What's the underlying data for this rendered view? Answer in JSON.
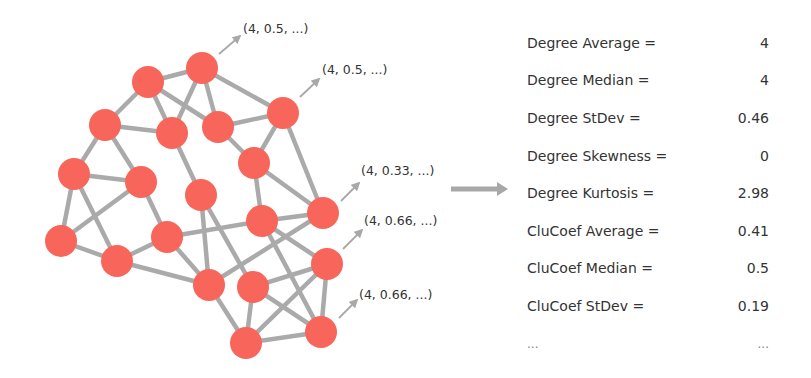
{
  "colors": {
    "node": "#F8655A",
    "edge": "#AAAAAA",
    "arrow": "#A8A8A8",
    "text": "#333333"
  },
  "graph": {
    "node_radius": 16,
    "nodes": [
      {
        "id": "A",
        "x": 202,
        "y": 68
      },
      {
        "id": "B",
        "x": 148,
        "y": 82
      },
      {
        "id": "C",
        "x": 105,
        "y": 125
      },
      {
        "id": "D",
        "x": 172,
        "y": 133
      },
      {
        "id": "E",
        "x": 218,
        "y": 127
      },
      {
        "id": "F",
        "x": 283,
        "y": 113
      },
      {
        "id": "G",
        "x": 254,
        "y": 163
      },
      {
        "id": "H",
        "x": 74,
        "y": 174
      },
      {
        "id": "I",
        "x": 141,
        "y": 182
      },
      {
        "id": "J",
        "x": 201,
        "y": 195
      },
      {
        "id": "K",
        "x": 323,
        "y": 213
      },
      {
        "id": "L",
        "x": 262,
        "y": 221
      },
      {
        "id": "M",
        "x": 61,
        "y": 241
      },
      {
        "id": "N",
        "x": 167,
        "y": 237
      },
      {
        "id": "O",
        "x": 117,
        "y": 261
      },
      {
        "id": "P",
        "x": 327,
        "y": 264
      },
      {
        "id": "Q",
        "x": 209,
        "y": 285
      },
      {
        "id": "R",
        "x": 253,
        "y": 287
      },
      {
        "id": "S",
        "x": 321,
        "y": 332
      },
      {
        "id": "T",
        "x": 246,
        "y": 343
      }
    ],
    "edges": [
      [
        "B",
        "A"
      ],
      [
        "B",
        "C"
      ],
      [
        "B",
        "D"
      ],
      [
        "B",
        "E"
      ],
      [
        "A",
        "D"
      ],
      [
        "A",
        "E"
      ],
      [
        "A",
        "F"
      ],
      [
        "C",
        "D"
      ],
      [
        "C",
        "H"
      ],
      [
        "C",
        "I"
      ],
      [
        "E",
        "F"
      ],
      [
        "E",
        "G"
      ],
      [
        "F",
        "G"
      ],
      [
        "F",
        "K"
      ],
      [
        "D",
        "J"
      ],
      [
        "G",
        "K"
      ],
      [
        "G",
        "L"
      ],
      [
        "H",
        "I"
      ],
      [
        "H",
        "M"
      ],
      [
        "H",
        "O"
      ],
      [
        "I",
        "M"
      ],
      [
        "I",
        "N"
      ],
      [
        "M",
        "O"
      ],
      [
        "O",
        "N"
      ],
      [
        "O",
        "Q"
      ],
      [
        "N",
        "Q"
      ],
      [
        "N",
        "L"
      ],
      [
        "J",
        "Q"
      ],
      [
        "J",
        "R"
      ],
      [
        "L",
        "K"
      ],
      [
        "L",
        "P"
      ],
      [
        "L",
        "S"
      ],
      [
        "K",
        "Q"
      ],
      [
        "R",
        "P"
      ],
      [
        "R",
        "T"
      ],
      [
        "R",
        "S"
      ],
      [
        "P",
        "T"
      ],
      [
        "P",
        "S"
      ],
      [
        "Q",
        "T"
      ],
      [
        "T",
        "S"
      ]
    ],
    "annotations": [
      {
        "text": "(4, 0.5, ...)",
        "from": [
          219,
          54
        ],
        "to": [
          240,
          36
        ],
        "label_x": 243,
        "label_y": 21
      },
      {
        "text": "(4, 0.5, ...)",
        "from": [
          300,
          97
        ],
        "to": [
          319,
          79
        ],
        "label_x": 322,
        "label_y": 62
      },
      {
        "text": "(4, 0.33, ...)",
        "from": [
          341,
          201
        ],
        "to": [
          359,
          183
        ],
        "label_x": 361,
        "label_y": 163
      },
      {
        "text": "(4, 0.66, ...)",
        "from": [
          343,
          249
        ],
        "to": [
          362,
          230
        ],
        "label_x": 364,
        "label_y": 213
      },
      {
        "text": "(4, 0.66, ...)",
        "from": [
          339,
          318
        ],
        "to": [
          357,
          300
        ],
        "label_x": 359,
        "label_y": 287
      }
    ]
  },
  "transform_arrow": {
    "x1": 451,
    "y1": 189,
    "x2": 508,
    "y2": 189
  },
  "stats": [
    {
      "label": "Degree Average =",
      "value": "4"
    },
    {
      "label": "Degree Median =",
      "value": "4"
    },
    {
      "label": "Degree StDev =",
      "value": "0.46"
    },
    {
      "label": "Degree Skewness =",
      "value": "0"
    },
    {
      "label": "Degree Kurtosis =",
      "value": "2.98"
    },
    {
      "label": "CluCoef Average =",
      "value": "0.41"
    },
    {
      "label": "CluCoef Median =",
      "value": "0.5"
    },
    {
      "label": "CluCoef StDev =",
      "value": "0.19"
    },
    {
      "label": "...",
      "value": "..."
    }
  ]
}
